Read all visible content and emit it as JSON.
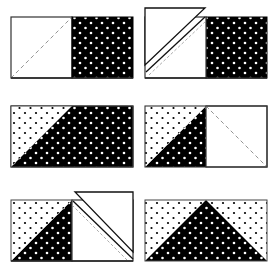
{
  "diagram": {
    "type": "quilting-construction-steps",
    "colors": {
      "background": "#ffffff",
      "outline": "#222222",
      "dark_fabric": "#000000",
      "dark_fabric_dot": "#ffffff",
      "light_fabric": "#ffffff",
      "light_fabric_dot": "#000000",
      "seam_guide": "#999999"
    },
    "steps": [
      {
        "id": 1,
        "label": "Step 1",
        "description": "Plain light square with dashed diagonal guide beside dark dotted rectangle"
      },
      {
        "id": 2,
        "label": "Step 2",
        "description": "Light square placed on rectangle, sewn on diagonal, corner trimmed and flipped"
      },
      {
        "id": 3,
        "label": "Step 3",
        "description": "Light dotted triangle pressed open in upper-left corner of dark rectangle"
      },
      {
        "id": 4,
        "label": "Step 4",
        "description": "Second light square with dashed diagonal placed on right half"
      },
      {
        "id": 5,
        "label": "Step 5",
        "description": "Second square sewn on diagonal, corner trimmed and flipped"
      },
      {
        "id": 6,
        "label": "Step 6",
        "description": "Finished flying geese unit: dark dotted triangle between two light dotted corners"
      }
    ]
  }
}
